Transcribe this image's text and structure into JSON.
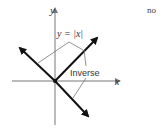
{
  "figure": {
    "y_axis_label": "y",
    "x_axis_label": "x",
    "graph_label": "y = |x|",
    "inverse_label": "Inverse",
    "corner_text": "no",
    "colors": {
      "axis": "#777777",
      "graph": "#111111",
      "leader": "#777777",
      "text": "#333333"
    }
  }
}
